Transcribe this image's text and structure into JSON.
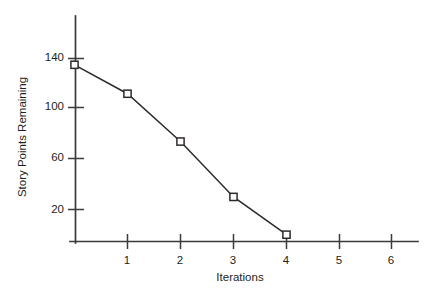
{
  "chart_data": {
    "type": "line",
    "title": "",
    "subtitle": "",
    "xlabel": "Iterations",
    "ylabel": "Story Points Remaining",
    "x": [
      0,
      1,
      2,
      3,
      4
    ],
    "values": [
      135,
      112,
      74,
      30,
      0
    ],
    "series": [
      {
        "name": "Story Points Remaining",
        "x": [
          0,
          1,
          2,
          3,
          4
        ],
        "values": [
          135,
          112,
          74,
          30,
          0
        ]
      }
    ],
    "xlim": [
      -0.1,
      6.5
    ],
    "ylim": [
      0,
      160
    ],
    "x_ticks": [
      1,
      2,
      3,
      4,
      5,
      6
    ],
    "x_tick_labels": [
      "1",
      "2",
      "3",
      "4",
      "5",
      "6"
    ],
    "y_ticks": [
      20,
      60,
      100,
      140
    ],
    "y_tick_labels": [
      "20",
      "60",
      "100",
      "140"
    ],
    "grid": false,
    "legend": false,
    "legend_position": "none",
    "marker": "open-square",
    "line_color": "#2e2a2a",
    "marker_fill": "#ffffff",
    "axis_color": "#3a3a3a",
    "background": "#ffffff"
  }
}
